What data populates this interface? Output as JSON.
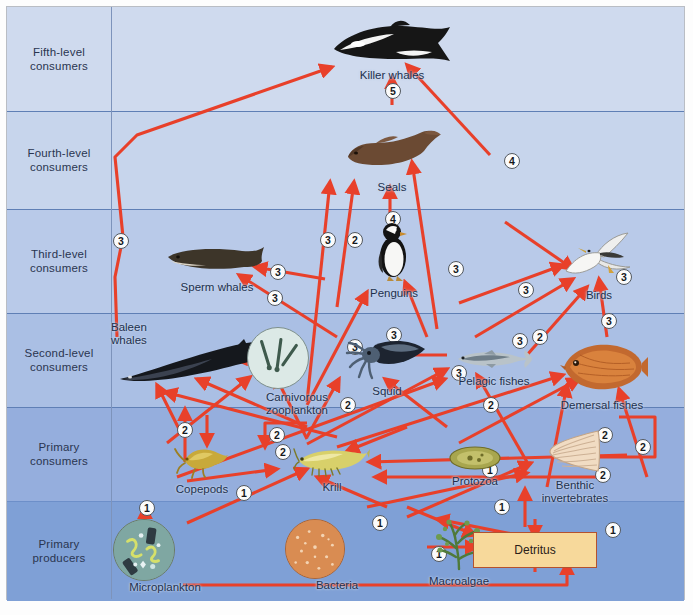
{
  "diagram": {
    "accent_arrow_color": "#e8402a",
    "detritus_fill": "#f7d99b",
    "detritus_border": "#b4522f"
  },
  "levels": [
    {
      "id": "fifth",
      "line1": "Fifth-level",
      "line2": "consumers"
    },
    {
      "id": "fourth",
      "line1": "Fourth-level",
      "line2": "consumers"
    },
    {
      "id": "third",
      "line1": "Third-level",
      "line2": "consumers"
    },
    {
      "id": "second",
      "line1": "Second-level",
      "line2": "consumers"
    },
    {
      "id": "primaryc",
      "line1": "Primary",
      "line2": "consumers"
    },
    {
      "id": "producers",
      "line1": "Primary",
      "line2": "producers"
    }
  ],
  "organisms": [
    {
      "id": "killer_whales",
      "label": "Killer whales",
      "level": "fifth"
    },
    {
      "id": "seals",
      "label": "Seals",
      "level": "fourth"
    },
    {
      "id": "sperm_whales",
      "label": "Sperm whales",
      "level": "third"
    },
    {
      "id": "penguins",
      "label": "Penguins",
      "level": "third"
    },
    {
      "id": "birds",
      "label": "Birds",
      "level": "third"
    },
    {
      "id": "baleen_whales",
      "label": "Baleen whales",
      "level": "second"
    },
    {
      "id": "carnivorous_zooplankton",
      "label": "Carnivorous zooplankton",
      "level": "second"
    },
    {
      "id": "squid",
      "label": "Squid",
      "level": "second"
    },
    {
      "id": "pelagic_fishes",
      "label": "Pelagic fishes",
      "level": "second"
    },
    {
      "id": "demersal_fishes",
      "label": "Demersal fishes",
      "level": "second"
    },
    {
      "id": "copepods",
      "label": "Copepods",
      "level": "primaryc"
    },
    {
      "id": "krill",
      "label": "Krill",
      "level": "primaryc"
    },
    {
      "id": "protozoa",
      "label": "Protozoa",
      "level": "primaryc"
    },
    {
      "id": "benthic_invertebrates",
      "label": "Benthic invertebrates",
      "level": "primaryc"
    },
    {
      "id": "microplankton",
      "label": "Microplankton",
      "level": "producers"
    },
    {
      "id": "bacteria",
      "label": "Bacteria",
      "level": "producers"
    },
    {
      "id": "macroalgae",
      "label": "Macroalgae",
      "level": "producers"
    },
    {
      "id": "detritus",
      "label": "Detritus",
      "level": "producers"
    }
  ],
  "link_labels": {
    "l1": "5",
    "l2": "3",
    "l3": "4",
    "l4": "3",
    "l5": "2",
    "l6": "4",
    "l7": "3",
    "l8": "3",
    "l9": "3",
    "l10": "3",
    "l11": "2",
    "l12": "3",
    "l13": "3",
    "l14": "2",
    "l15": "3",
    "l16": "3",
    "l17": "3",
    "l18": "2",
    "l19": "2",
    "l20": "2",
    "l21": "2",
    "l22": "2",
    "l23": "2",
    "l24": "1",
    "l25": "1",
    "l26": "1",
    "l27": "1",
    "l28": "1",
    "l29": "1",
    "l30": "1",
    "l31": "1",
    "l32": "2",
    "l33": "3",
    "l34": "2"
  }
}
